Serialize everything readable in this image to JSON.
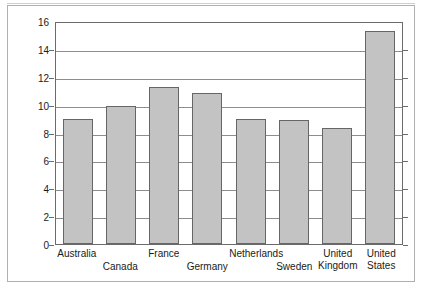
{
  "chart_data": {
    "type": "bar",
    "title": "",
    "xlabel": "",
    "ylabel": "% GDP",
    "ylim": [
      0,
      16
    ],
    "ytick_step": 2,
    "yticks": [
      16,
      14,
      12,
      10,
      8,
      6,
      4,
      2,
      0
    ],
    "grid": true,
    "legend": "none",
    "categories": [
      "Australia",
      "Canada",
      "France",
      "Germany",
      "Netherlands",
      "Sweden",
      "United Kingdom",
      "United States"
    ],
    "category_label_rows": [
      0,
      1,
      0,
      1,
      0,
      1,
      0,
      0
    ],
    "values": [
      9.0,
      9.9,
      11.3,
      10.8,
      9.0,
      8.9,
      8.3,
      15.3
    ],
    "bar_color": "#c3c3c3",
    "bar_edge_color": "#666666",
    "axis_color": "#6b6b6b",
    "gridline_color": "#8d8d8d"
  },
  "axis": {
    "y_title": "% GDP"
  }
}
